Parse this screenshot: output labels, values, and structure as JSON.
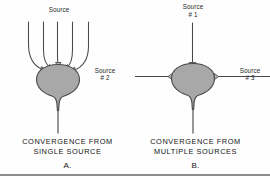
{
  "figure": {
    "title_alt": "Neuronal convergence diagram",
    "background_color": "#fefefe",
    "line_color": "#4a4a4a",
    "soma_fill": "#a8a8a8",
    "text_color": "#141414",
    "rule_color": "#8f8f8f"
  },
  "panel_a": {
    "letter": "A.",
    "source_label": "Source",
    "caption_line1": "CONVERGENCE FROM",
    "caption_line2": "SINGLE SOURCE",
    "dendrite_count": 5,
    "soma_label": "cell-body",
    "axon_label": "axon"
  },
  "panel_b": {
    "letter": "B.",
    "source_1_line1": "Source",
    "source_1_line2": "# 1",
    "source_2_line1": "Source",
    "source_2_line2": "# 2",
    "source_3_line1": "Source",
    "source_3_line2": "# 3",
    "caption_line1": "CONVERGENCE FROM",
    "caption_line2": "MULTIPLE SOURCES",
    "input_count": 3,
    "soma_label": "cell-body",
    "axon_label": "axon"
  }
}
